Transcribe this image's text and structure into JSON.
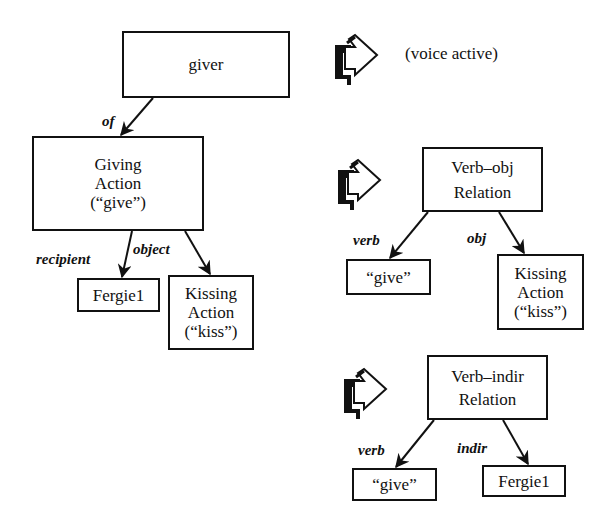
{
  "left_tree": {
    "giver": {
      "label": "giver"
    },
    "edge_of": {
      "label": "of"
    },
    "giving_action": {
      "lines": [
        "Giving",
        "Action",
        "(“give”)"
      ]
    },
    "edge_recipient": {
      "label": "recipient"
    },
    "edge_object": {
      "label": "object"
    },
    "fergie": {
      "label": "Fergie1"
    },
    "kissing_action": {
      "lines": [
        "Kissing",
        "Action",
        "(“kiss”)"
      ]
    }
  },
  "voice_row": {
    "icon": "hand-pointer-arrow-icon",
    "label": "(voice active)"
  },
  "verb_obj_tree": {
    "icon": "hand-pointer-arrow-icon",
    "root": {
      "lines": [
        "Verb–obj",
        "Relation"
      ]
    },
    "edge_verb": {
      "label": "verb"
    },
    "edge_obj": {
      "label": "obj"
    },
    "verb_node": {
      "label": "“give”"
    },
    "obj_node": {
      "lines": [
        "Kissing",
        "Action",
        "(“kiss”)"
      ]
    }
  },
  "verb_indir_tree": {
    "icon": "hand-pointer-arrow-icon",
    "root": {
      "lines": [
        "Verb–indir",
        "Relation"
      ]
    },
    "edge_verb": {
      "label": "verb"
    },
    "edge_indir": {
      "label": "indir"
    },
    "verb_node": {
      "label": "“give”"
    },
    "indir_node": {
      "label": "Fergie1"
    }
  },
  "colors": {
    "ink": "#111111",
    "background": "#ffffff"
  }
}
